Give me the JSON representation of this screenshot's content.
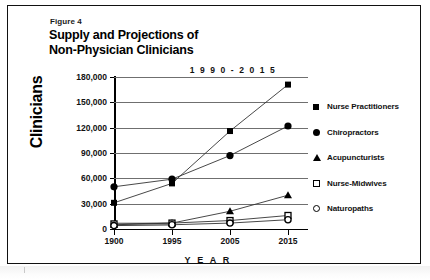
{
  "figure": {
    "label": "Figure 4",
    "title_line1": "Supply and Projections of",
    "title_line2": "Non-Physician Clinicians"
  },
  "chart_data": {
    "type": "line",
    "title": "Supply and Projections of Non-Physician Clinicians",
    "subtitle": "1 9 9 0 - 2 0 1 5",
    "xlabel": "Y E A R",
    "ylabel": "Clinicians",
    "categories": [
      "1900",
      "1995",
      "2005",
      "2015"
    ],
    "x_tick_labels": [
      "1900",
      "1995",
      "2005",
      "2015"
    ],
    "y_tick_labels": [
      "0",
      "30,000",
      "60,000",
      "90,000",
      "120,000",
      "150,000",
      "180,000"
    ],
    "y_tick_values": [
      0,
      30000,
      60000,
      90000,
      120000,
      150000,
      180000
    ],
    "ylim": [
      0,
      180000
    ],
    "grid": "horizontal",
    "legend_position": "right",
    "series": [
      {
        "name": "Nurse Practitioners",
        "marker": "filled-square",
        "values": [
          31000,
          54000,
          116000,
          171000
        ]
      },
      {
        "name": "Chiropractors",
        "marker": "filled-circle",
        "values": [
          50000,
          59000,
          87000,
          122000
        ]
      },
      {
        "name": "Acupuncturists",
        "marker": "filled-triangle",
        "values": [
          5000,
          7000,
          21000,
          40000
        ]
      },
      {
        "name": "Nurse-Midwives",
        "marker": "open-square",
        "values": [
          6000,
          7000,
          10000,
          16000
        ]
      },
      {
        "name": "Naturopaths",
        "marker": "open-circle",
        "values": [
          4000,
          5000,
          7000,
          11000
        ]
      }
    ],
    "annotations": [
      {
        "name": "shaded-band",
        "from_category": "1900",
        "to_category": "1995",
        "y_low": 3000,
        "y_high": 8000,
        "color": "#c3c3c3"
      }
    ]
  }
}
